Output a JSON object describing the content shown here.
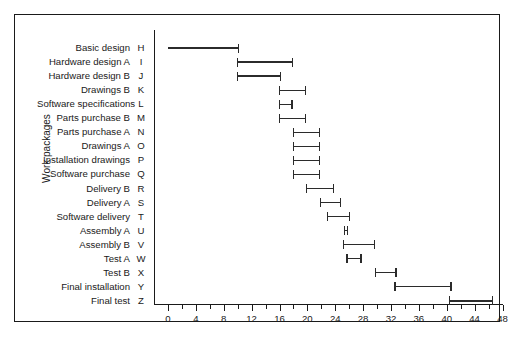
{
  "chart_data": {
    "type": "bar",
    "title": "",
    "subtitle": "",
    "xlabel": "",
    "ylabel": "Work packages",
    "xlim": [
      0,
      48
    ],
    "ylim": null,
    "grid": false,
    "legend": null,
    "orientation": "horizontal",
    "style": "gantt",
    "xticks": [
      0,
      2,
      4,
      6,
      8,
      10,
      12,
      14,
      16,
      18,
      20,
      22,
      24,
      26,
      28,
      30,
      32,
      34,
      36,
      38,
      40,
      42,
      44,
      46,
      48
    ],
    "xtick_labels": [
      "0",
      "",
      "4",
      "",
      "8",
      "",
      "12",
      "",
      "16",
      "",
      "20",
      "",
      "24",
      "",
      "28",
      "",
      "32",
      "",
      "36",
      "",
      "40",
      "",
      "44",
      "",
      "48"
    ],
    "categories": [
      "Basic design",
      "Hardware design A",
      "Hardware design B",
      "Drawings B",
      "Software specifications",
      "Parts purchase B",
      "Parts purchase A",
      "Drawings A",
      "Installation drawings",
      "Software purchase",
      "Delivery B",
      "Delivery A",
      "Software delivery",
      "Assembly A",
      "Assembly B",
      "Test A",
      "Test B",
      "Final installation",
      "Final test"
    ],
    "codes": [
      "H",
      "I",
      "J",
      "K",
      "L",
      "M",
      "N",
      "O",
      "P",
      "Q",
      "R",
      "S",
      "T",
      "U",
      "V",
      "W",
      "X",
      "Y",
      "Z"
    ],
    "tasks": [
      {
        "code": "H",
        "label": "Basic design",
        "start": 0.0,
        "end": 10.2
      },
      {
        "code": "I",
        "label": "Hardware design A",
        "start": 9.9,
        "end": 18.0
      },
      {
        "code": "J",
        "label": "Hardware design B",
        "start": 9.9,
        "end": 16.2
      },
      {
        "code": "K",
        "label": "Drawings B",
        "start": 15.9,
        "end": 19.8
      },
      {
        "code": "L",
        "label": "Software specifications",
        "start": 15.9,
        "end": 17.9
      },
      {
        "code": "M",
        "label": "Parts purchase B",
        "start": 15.9,
        "end": 19.8
      },
      {
        "code": "N",
        "label": "Parts purchase A",
        "start": 17.9,
        "end": 21.8
      },
      {
        "code": "O",
        "label": "Drawings A",
        "start": 17.9,
        "end": 21.8
      },
      {
        "code": "P",
        "label": "Installation drawings",
        "start": 17.9,
        "end": 21.8
      },
      {
        "code": "Q",
        "label": "Software purchase",
        "start": 17.9,
        "end": 21.8
      },
      {
        "code": "R",
        "label": "Delivery B",
        "start": 19.8,
        "end": 23.8
      },
      {
        "code": "S",
        "label": "Delivery A",
        "start": 21.8,
        "end": 24.8
      },
      {
        "code": "T",
        "label": "Software delivery",
        "start": 22.8,
        "end": 26.1
      },
      {
        "code": "U",
        "label": "Assembly A",
        "start": 25.2,
        "end": 25.9
      },
      {
        "code": "V",
        "label": "Assembly B",
        "start": 25.1,
        "end": 29.7
      },
      {
        "code": "W",
        "label": "Test A",
        "start": 25.6,
        "end": 27.8
      },
      {
        "code": "X",
        "label": "Test B",
        "start": 29.7,
        "end": 32.8
      },
      {
        "code": "Y",
        "label": "Final installation",
        "start": 32.5,
        "end": 40.7
      },
      {
        "code": "Z",
        "label": "Final test",
        "start": 40.3,
        "end": 46.7
      }
    ]
  },
  "colors": {
    "bar": "#2b2b2b",
    "axis": "#1a1a1a",
    "frame": "#1a1a1a",
    "background": "#ffffff",
    "text": "#1a1a1a"
  }
}
